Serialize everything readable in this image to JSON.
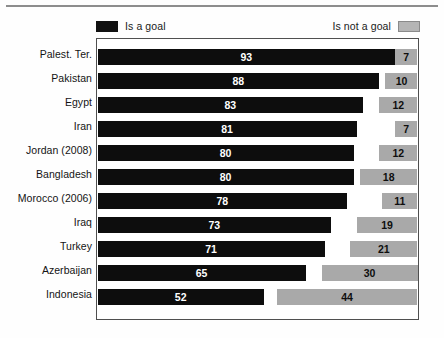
{
  "figure": {
    "legend": {
      "goal_label": "Is a goal",
      "notgoal_label": "Is not a goal",
      "goal_swatch_icon": "black-square-swatch-icon",
      "notgoal_swatch_icon": "gray-square-swatch-icon"
    },
    "colors": {
      "goal": "#0d0d0d",
      "not_goal": "#a9a9a9",
      "gap": "#ffffff",
      "frame": "#4f4f4f",
      "rule": "#8d8d8d",
      "text": "#141414"
    }
  },
  "chart_data": {
    "type": "bar",
    "orientation": "horizontal",
    "stacked": true,
    "title": "",
    "subtitle": "",
    "xlabel": "",
    "ylabel": "",
    "xlim": [
      0,
      100
    ],
    "grid": false,
    "legend_position": "top",
    "categories": [
      "Palest. Ter.",
      "Pakistan",
      "Egypt",
      "Iran",
      "Jordan (2008)",
      "Bangladesh",
      "Morocco (2006)",
      "Iraq",
      "Turkey",
      "Azerbaijan",
      "Indonesia"
    ],
    "series": [
      {
        "name": "Is a goal",
        "color": "#0d0d0d",
        "values": [
          93,
          88,
          83,
          81,
          80,
          80,
          78,
          73,
          71,
          65,
          52
        ]
      },
      {
        "name": "Neither / no answer",
        "color": "#ffffff",
        "values": [
          0,
          2,
          5,
          12,
          8,
          2,
          11,
          8,
          8,
          5,
          4
        ]
      },
      {
        "name": "Is not a goal",
        "color": "#a9a9a9",
        "values": [
          7,
          10,
          12,
          7,
          12,
          18,
          11,
          19,
          21,
          30,
          44
        ]
      }
    ],
    "rows": [
      {
        "label": "Palest. Ter.",
        "goal": 93,
        "gap": 0,
        "not_goal": 7
      },
      {
        "label": "Pakistan",
        "goal": 88,
        "gap": 2,
        "not_goal": 10
      },
      {
        "label": "Egypt",
        "goal": 83,
        "gap": 5,
        "not_goal": 12
      },
      {
        "label": "Iran",
        "goal": 81,
        "gap": 12,
        "not_goal": 7
      },
      {
        "label": "Jordan (2008)",
        "goal": 80,
        "gap": 8,
        "not_goal": 12
      },
      {
        "label": "Bangladesh",
        "goal": 80,
        "gap": 2,
        "not_goal": 18
      },
      {
        "label": "Morocco (2006)",
        "goal": 78,
        "gap": 11,
        "not_goal": 11
      },
      {
        "label": "Iraq",
        "goal": 73,
        "gap": 8,
        "not_goal": 19
      },
      {
        "label": "Turkey",
        "goal": 71,
        "gap": 8,
        "not_goal": 21
      },
      {
        "label": "Azerbaijan",
        "goal": 65,
        "gap": 5,
        "not_goal": 30
      },
      {
        "label": "Indonesia",
        "goal": 52,
        "gap": 4,
        "not_goal": 44
      }
    ]
  }
}
